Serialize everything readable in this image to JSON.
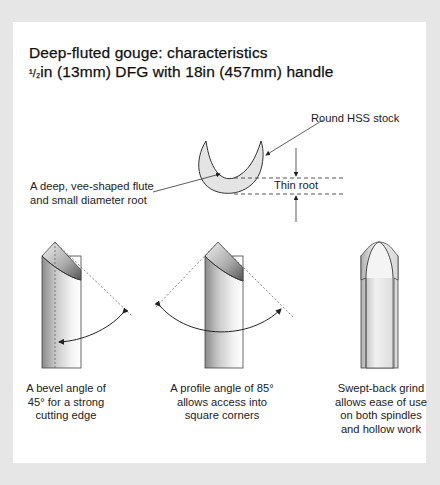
{
  "title": {
    "line1": "Deep-fluted gouge: characteristics",
    "line2_fraction": "¹/₂",
    "line2_rest": "in (13mm) DFG with 18in (457mm) handle"
  },
  "cross_section": {
    "stock_label": "Round HSS stock",
    "flute_label_line1": "A deep, vee-shaped flute",
    "flute_label_line2": "and small diameter root",
    "root_label": "Thin root"
  },
  "captions": [
    {
      "id": "bevel",
      "lines": [
        "A bevel angle of",
        "45° for a strong",
        "cutting edge"
      ]
    },
    {
      "id": "profile",
      "lines": [
        "A profile angle of 85°",
        "allows access into",
        "square corners"
      ]
    },
    {
      "id": "grind",
      "lines": [
        "Swept-back grind",
        "allows ease of use",
        "on both spindles",
        "and hollow work"
      ]
    }
  ],
  "colors": {
    "background": "#e6e6e6",
    "card": "#ffffff",
    "line": "#333333",
    "fill_light": "#e4e4e4"
  }
}
